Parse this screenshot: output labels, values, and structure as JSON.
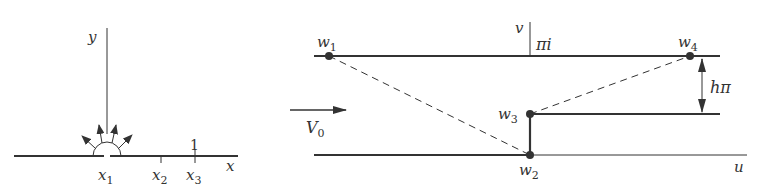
{
  "left_panel": {
    "axis_labels": {
      "x": "x",
      "y": "y"
    },
    "points": [
      {
        "name": "x1",
        "base": "x",
        "sub": "1"
      },
      {
        "name": "x2",
        "base": "x",
        "sub": "2"
      },
      {
        "name": "x3",
        "base": "x",
        "sub": "3"
      }
    ],
    "tick_label_x3": "1",
    "source_arrows_count": 4
  },
  "right_panel": {
    "axis_labels": {
      "u": "u",
      "v": "v"
    },
    "top_line_label": "πi",
    "step_height_label": "hπ",
    "flow_label": {
      "base": "V",
      "sub": "0"
    },
    "vertices": [
      {
        "name": "w1",
        "base": "w",
        "sub": "1"
      },
      {
        "name": "w2",
        "base": "w",
        "sub": "2"
      },
      {
        "name": "w3",
        "base": "w",
        "sub": "3"
      },
      {
        "name": "w4",
        "base": "w",
        "sub": "4"
      }
    ]
  },
  "colors": {
    "line": "#333333",
    "background": "#ffffff"
  }
}
